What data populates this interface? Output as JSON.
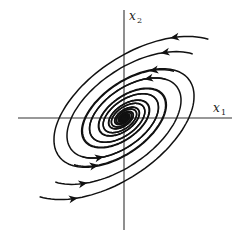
{
  "figure": {
    "type": "phase-portrait",
    "axes": {
      "x_label": "x",
      "x_sub": "1",
      "y_label": "x",
      "y_sub": "2"
    },
    "colors": {
      "stroke": "#111111",
      "axis": "#333333",
      "background": "#ffffff"
    },
    "origin_px": [
      124,
      118
    ],
    "tilt_deg": -35,
    "trajectories": [
      {
        "start_radius": 118,
        "arrow_side": "both"
      },
      {
        "start_radius": 96,
        "arrow_side": "both"
      },
      {
        "start_radius": 70,
        "arrow_side": "both"
      },
      {
        "start_radius": 58,
        "arrow_side": "both"
      }
    ]
  }
}
